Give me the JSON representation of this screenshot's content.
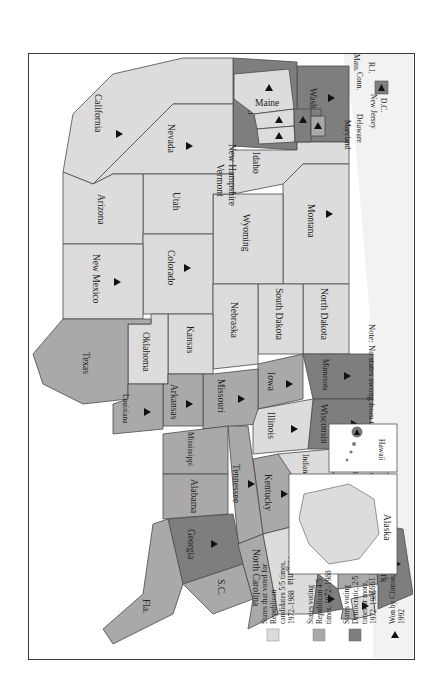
{
  "map": {
    "title": "Presidential voting 1972-1988 and Clinton wins 1992",
    "orientation": "rotated 90 degrees clockwise",
    "colors": {
      "republican_5_of_5": "#dcdcdc",
      "republican_4_of_5": "#a9a9a9",
      "democratic_2_of_5_or_more": "#7e7e7e",
      "triangle": "#111111",
      "border": "#3a3a3a"
    },
    "states": {
      "washington": {
        "label": "Washington",
        "category": 3,
        "clinton": true
      },
      "oregon": {
        "label": "Oregon",
        "category": 3,
        "clinton": true
      },
      "california": {
        "label": "California",
        "category": 1,
        "clinton": true
      },
      "nevada": {
        "label": "Nevada",
        "category": 1,
        "clinton": true
      },
      "idaho": {
        "label": "Idaho",
        "category": 1,
        "clinton": false
      },
      "montana": {
        "label": "Montana",
        "category": 1,
        "clinton": true
      },
      "wyoming": {
        "label": "Wyoming",
        "category": 1,
        "clinton": false
      },
      "utah": {
        "label": "Utah",
        "category": 1,
        "clinton": false
      },
      "arizona": {
        "label": "Arizona",
        "category": 1,
        "clinton": false
      },
      "colorado": {
        "label": "Colorado",
        "category": 1,
        "clinton": true
      },
      "new_mexico": {
        "label": "New Mexico",
        "category": 1,
        "clinton": true
      },
      "north_dakota": {
        "label": "North Dakota",
        "category": 1,
        "clinton": false
      },
      "south_dakota": {
        "label": "South Dakota",
        "category": 1,
        "clinton": false
      },
      "nebraska": {
        "label": "Nebraska",
        "category": 1,
        "clinton": false
      },
      "kansas": {
        "label": "Kansas",
        "category": 1,
        "clinton": false
      },
      "oklahoma": {
        "label": "Oklahoma",
        "category": 1,
        "clinton": false
      },
      "texas": {
        "label": "Texas",
        "category": 2,
        "clinton": false
      },
      "minnesota": {
        "label": "Minnesota",
        "category": 3,
        "clinton": true
      },
      "iowa": {
        "label": "Iowa",
        "category": 2,
        "clinton": true
      },
      "missouri": {
        "label": "Missouri",
        "category": 2,
        "clinton": true
      },
      "arkansas": {
        "label": "Arkansas",
        "category": 2,
        "clinton": true
      },
      "louisiana": {
        "label": "Louisiana",
        "category": 2,
        "clinton": true
      },
      "wisconsin": {
        "label": "Wisconsin",
        "category": 3,
        "clinton": true
      },
      "illinois": {
        "label": "Illinois",
        "category": 1,
        "clinton": true
      },
      "michigan": {
        "label": "Michigan",
        "category": 1,
        "clinton": true
      },
      "indiana": {
        "label": "Indiana",
        "category": 1,
        "clinton": false
      },
      "ohio": {
        "label": "Ohio",
        "category": 2,
        "clinton": true
      },
      "kentucky": {
        "label": "Kentucky",
        "category": 2,
        "clinton": true
      },
      "tennessee": {
        "label": "Tennessee",
        "category": 2,
        "clinton": true
      },
      "mississippi": {
        "label": "Mississippi",
        "category": 2,
        "clinton": false
      },
      "alabama": {
        "label": "Alabama",
        "category": 2,
        "clinton": false
      },
      "georgia": {
        "label": "Georgia",
        "category": 3,
        "clinton": true
      },
      "florida": {
        "label": "Fla.",
        "category": 2,
        "clinton": false
      },
      "south_carolina": {
        "label": "S.C.",
        "category": 2,
        "clinton": false
      },
      "north_carolina": {
        "label": "North Carolina",
        "category": 2,
        "clinton": false
      },
      "virginia": {
        "label": "Virginia",
        "category": 1,
        "clinton": false
      },
      "west_virginia": {
        "label": "W.V.",
        "category": 3,
        "clinton": true
      },
      "pennsylvania": {
        "label": "Pennsylvania",
        "category": 2,
        "clinton": true
      },
      "new_york": {
        "label": "New York",
        "category": 3,
        "clinton": true
      },
      "maine": {
        "label": "Maine",
        "category": 1,
        "clinton": true
      },
      "new_hampshire": {
        "label": "New Hampshire",
        "category": 1,
        "clinton": true
      },
      "vermont": {
        "label": "Vermont",
        "category": 1,
        "clinton": true
      },
      "massachusetts": {
        "label": "Mass.",
        "category": 3,
        "clinton": true
      },
      "rhode_island": {
        "label": "R.I.",
        "category": 3,
        "clinton": true
      },
      "connecticut": {
        "label": "Conn.",
        "category": 2,
        "clinton": true
      },
      "new_jersey": {
        "label": "New Jersey",
        "category": 1,
        "clinton": true
      },
      "delaware": {
        "label": "Delaware",
        "category": 2,
        "clinton": true
      },
      "maryland": {
        "label": "Maryland",
        "category": 3,
        "clinton": true
      },
      "dc": {
        "label": "D.C.",
        "category": 3,
        "clinton": true
      },
      "alaska": {
        "label": "Alaska",
        "category": 1,
        "clinton": false
      },
      "hawaii": {
        "label": "Hawaii",
        "category": 3,
        "clinton": true
      }
    },
    "note": "Note: No states swung from the Democrats to the GOP between 1988 and 1992."
  },
  "legend": {
    "items": [
      {
        "label_lines": [
          "States that voted for",
          "Republican",
          "candidates 5/5 times,",
          "1972–1988"
        ],
        "color": "#dcdcdc"
      },
      {
        "label_lines": [
          "States voting",
          "Republican 4/5",
          "times, 1972–1988"
        ],
        "color": "#a9a9a9"
      },
      {
        "label_lines": [
          "States voting",
          "Democratic, 2/5",
          "times or more,",
          "1972–1988"
        ],
        "color": "#7e7e7e"
      },
      {
        "label_lines": [
          "Won by Clinton,",
          "1992"
        ],
        "symbol": "▲"
      }
    ]
  }
}
